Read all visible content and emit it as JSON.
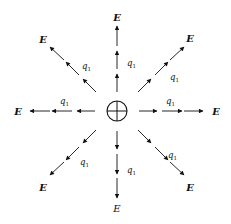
{
  "diagram": {
    "center_charge": {
      "symbol": "⊕",
      "sign": "positive"
    },
    "field_label": "E",
    "charge_label": {
      "base": "q",
      "subscript": "1"
    },
    "directions": [
      {
        "name": "up",
        "field_label": "E",
        "charge_label": "q1"
      },
      {
        "name": "upper-right",
        "field_label": "E",
        "charge_label": "q1"
      },
      {
        "name": "right",
        "field_label": "E",
        "charge_label": "q1"
      },
      {
        "name": "lower-right",
        "field_label": "E",
        "charge_label": "q1"
      },
      {
        "name": "down",
        "field_label": "E",
        "charge_label": "q1"
      },
      {
        "name": "lower-left",
        "field_label": "E",
        "charge_label": "q1"
      },
      {
        "name": "left",
        "field_label": "E",
        "charge_label": "q1"
      },
      {
        "name": "upper-left",
        "field_label": "E",
        "charge_label": "q1"
      }
    ],
    "arrows_per_line": 3,
    "colors": {
      "ink": "#111111",
      "background": "#ffffff"
    }
  }
}
